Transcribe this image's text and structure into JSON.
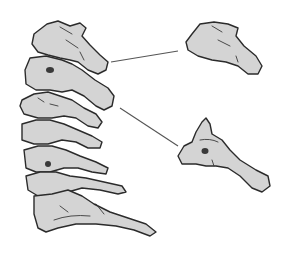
{
  "figure": {
    "colors": {
      "bone_fill": "#d4d4d4",
      "outline": "#2b2b2b",
      "background": "#ffffff",
      "leader_line": "#555555"
    },
    "parts": [
      {
        "id": "spine-column",
        "label": ""
      },
      {
        "id": "vertebra-detail-upper",
        "label": ""
      },
      {
        "id": "vertebra-detail-lower",
        "label": ""
      }
    ]
  }
}
